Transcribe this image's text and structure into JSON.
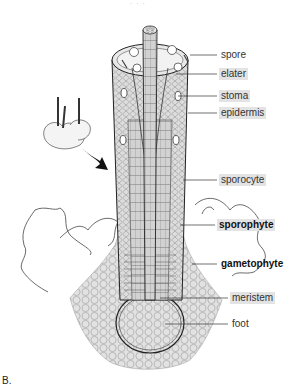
{
  "figure": {
    "panel_letter": "B.",
    "top_cutoff_text": "· · ·"
  },
  "labels": [
    {
      "id": "spore",
      "text": "spore",
      "highlight": false,
      "bold": false,
      "x": 219,
      "y": 49
    },
    {
      "id": "elater",
      "text": "elater",
      "highlight": true,
      "bold": false,
      "x": 219,
      "y": 68
    },
    {
      "id": "stoma",
      "text": "stoma",
      "highlight": true,
      "bold": false,
      "x": 219,
      "y": 90
    },
    {
      "id": "epidermis",
      "text": "epidermis",
      "highlight": true,
      "bold": false,
      "x": 219,
      "y": 107
    },
    {
      "id": "sporocyte",
      "text": "sporocyte",
      "highlight": true,
      "bold": false,
      "x": 219,
      "y": 174
    },
    {
      "id": "sporophyte",
      "text": "sporophyte",
      "highlight": true,
      "bold": true,
      "x": 217,
      "y": 219
    },
    {
      "id": "gametophyte",
      "text": "gametophyte",
      "highlight": false,
      "bold": true,
      "x": 219,
      "y": 258
    },
    {
      "id": "meristem",
      "text": "meristem",
      "highlight": true,
      "bold": false,
      "x": 230,
      "y": 292
    },
    {
      "id": "foot",
      "text": "foot",
      "highlight": false,
      "bold": false,
      "x": 230,
      "y": 318
    }
  ],
  "colors": {
    "label_highlight": "#e3e3e3",
    "ink": "#333333",
    "tissue": "#d9d9d9",
    "arrow": "#111111"
  }
}
